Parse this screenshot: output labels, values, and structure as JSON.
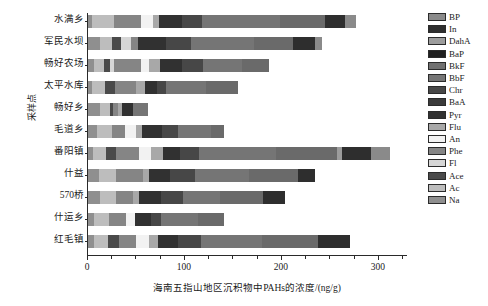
{
  "chart_data": {
    "type": "bar",
    "subtype": "stacked-horizontal-bar",
    "title": "",
    "xlabel": "海南五指山地区沉积物中PAHs的浓度/(ng/g)",
    "ylabel": "采样点",
    "xlim": [
      0,
      330
    ],
    "xticks": [
      0,
      100,
      200,
      300
    ],
    "xticklabels": [
      "0",
      "100",
      "200",
      "300"
    ],
    "xticks_minor": [
      25,
      50,
      75,
      125,
      150,
      175,
      225,
      250,
      275,
      325
    ],
    "grid": false,
    "legend_position": "right",
    "categories": [
      "水满乡",
      "军民水坝",
      "畅好农场",
      "太平水库",
      "畅好乡",
      "毛道乡",
      "番阳镇",
      "什益",
      "570桥",
      "什运乡",
      "红毛镇"
    ],
    "series": [
      {
        "name": "Na",
        "color": "#8f8f8f",
        "values": [
          4.0,
          12.0,
          6.0,
          4.0,
          12.0,
          9.0,
          5.0,
          11.0,
          12.0,
          6.0,
          6.0
        ]
      },
      {
        "name": "Ac",
        "color": "#bdbdbd",
        "values": [
          23.0,
          13.0,
          10.0,
          14.0,
          11.0,
          16.0,
          14.0,
          18.0,
          17.0,
          16.0,
          15.0
        ]
      },
      {
        "name": "Ace",
        "color": "#4a4a4a",
        "values": [
          0.0,
          9.0,
          7.0,
          10.0,
          3.0,
          0.0,
          10.0,
          0.0,
          0.0,
          0.0,
          11.0
        ]
      },
      {
        "name": "Fl",
        "color": "#d6d6d6",
        "values": [
          0.0,
          10.0,
          4.0,
          0.0,
          0.0,
          0.0,
          0.0,
          0.0,
          0.0,
          0.0,
          0.0
        ]
      },
      {
        "name": "Phe",
        "color": "#858585",
        "values": [
          28.0,
          8.0,
          28.0,
          22.0,
          5.0,
          13.0,
          24.0,
          28.0,
          17.0,
          17.0,
          18.0
        ]
      },
      {
        "name": "An",
        "color": "#f2f2f2",
        "values": [
          12.0,
          0.0,
          8.0,
          0.0,
          0.0,
          12.0,
          12.0,
          0.0,
          0.0,
          9.0,
          13.0
        ]
      },
      {
        "name": "Flu",
        "color": "#a8a8a8",
        "values": [
          6.0,
          0.0,
          11.0,
          9.0,
          4.0,
          6.0,
          12.0,
          6.0,
          7.0,
          0.0,
          9.0
        ]
      },
      {
        "name": "Pyr",
        "color": "#313131",
        "values": [
          24.0,
          28.0,
          23.0,
          12.0,
          11.0,
          20.0,
          18.0,
          22.0,
          22.0,
          17.0,
          21.0
        ]
      },
      {
        "name": "BaA",
        "color": "#3b3b3b",
        "values": [
          0.0,
          0.0,
          0.0,
          0.0,
          0.0,
          0.0,
          0.0,
          0.0,
          0.0,
          0.0,
          0.0
        ]
      },
      {
        "name": "Chr",
        "color": "#474747",
        "values": [
          21.0,
          26.0,
          22.0,
          9.0,
          0.0,
          17.0,
          20.0,
          25.0,
          23.0,
          10.0,
          24.0
        ]
      },
      {
        "name": "BbF",
        "color": "#757575",
        "values": [
          80.0,
          65.0,
          40.0,
          42.0,
          16.0,
          34.0,
          79.0,
          56.0,
          38.0,
          38.0,
          63.0
        ]
      },
      {
        "name": "BkF",
        "color": "#707070",
        "values": [
          0.0,
          0.0,
          0.0,
          0.0,
          0.0,
          0.0,
          0.0,
          0.0,
          0.0,
          0.0,
          0.0
        ]
      },
      {
        "name": "BaP",
        "color": "#6a6a6a",
        "values": [
          46.0,
          40.0,
          28.0,
          33.0,
          0.0,
          13.0,
          63.0,
          51.0,
          44.0,
          27.0,
          57.0
        ]
      },
      {
        "name": "DahA",
        "color": "#9c9c9c",
        "values": [
          0.0,
          0.0,
          0.0,
          0.0,
          0.0,
          0.0,
          5.0,
          0.0,
          0.0,
          0.0,
          0.0
        ]
      },
      {
        "name": "In",
        "color": "#2e2e2e",
        "values": [
          21.0,
          23.0,
          0.0,
          0.0,
          0.0,
          0.0,
          30.0,
          17.0,
          23.0,
          0.0,
          33.0
        ]
      },
      {
        "name": "BP",
        "color": "#8a8a8a",
        "values": [
          11.0,
          7.0,
          0.0,
          0.0,
          0.0,
          0.0,
          20.0,
          0.0,
          0.0,
          0.0,
          0.0
        ]
      }
    ],
    "totals": [
      276,
      241,
      187,
      155,
      62,
      140,
      312,
      234,
      203,
      140,
      270
    ]
  },
  "legend": {
    "items": [
      {
        "label": "BP",
        "color": "#8a8a8a"
      },
      {
        "label": "In",
        "color": "#2e2e2e"
      },
      {
        "label": "DahA",
        "color": "#9c9c9c"
      },
      {
        "label": "BaP",
        "color": "#1f1f1f"
      },
      {
        "label": "BkF",
        "color": "#707070"
      },
      {
        "label": "BbF",
        "color": "#757575"
      },
      {
        "label": "Chr",
        "color": "#474747"
      },
      {
        "label": "BaA",
        "color": "#3b3b3b"
      },
      {
        "label": "Pyr",
        "color": "#313131"
      },
      {
        "label": "Flu",
        "color": "#a8a8a8"
      },
      {
        "label": "An",
        "color": "#f2f2f2"
      },
      {
        "label": "Phe",
        "color": "#858585"
      },
      {
        "label": "Fl",
        "color": "#d6d6d6"
      },
      {
        "label": "Ace",
        "color": "#4a4a4a"
      },
      {
        "label": "Ac",
        "color": "#bdbdbd"
      },
      {
        "label": "Na",
        "color": "#8f8f8f"
      }
    ]
  }
}
